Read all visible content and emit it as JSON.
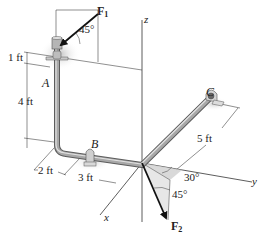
{
  "figure": {
    "type": "3D pipe assembly free-body diagram",
    "axes": {
      "x": "x",
      "y": "y",
      "z": "z"
    },
    "points": {
      "A": "A",
      "B": "B",
      "C": "C"
    },
    "forces": {
      "F1": {
        "symbol": "F",
        "subscript": "1",
        "angle_label": "45°"
      },
      "F2": {
        "symbol": "F",
        "subscript": "2",
        "angle_label_1": "30°",
        "angle_label_2": "45°"
      }
    },
    "dimensions": {
      "top_segment": "1 ft",
      "vertical_segment": "4 ft",
      "x_segment_1": "2 ft",
      "x_segment_2": "3 ft",
      "y_segment": "5 ft"
    },
    "colors": {
      "pipe": "#8c8c8c",
      "pipe_highlight": "#d8d8d8",
      "line": "#222222",
      "shade": "#cfcfcf"
    }
  }
}
